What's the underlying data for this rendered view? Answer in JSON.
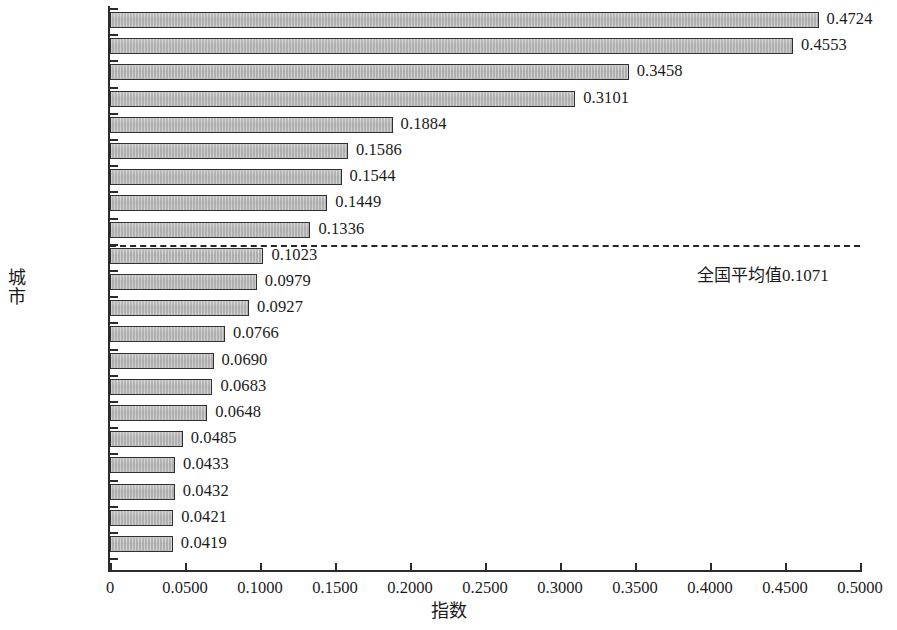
{
  "chart_data": {
    "type": "bar",
    "orientation": "horizontal",
    "title": "",
    "xlabel": "指数",
    "ylabel": "城市",
    "xlim": [
      0,
      0.5
    ],
    "grid": false,
    "legend": null,
    "xticks": [
      "0",
      "0.0500",
      "0.1000",
      "0.1500",
      "0.2000",
      "0.2500",
      "0.3000",
      "0.3500",
      "0.4000",
      "0.4500",
      "0.5000"
    ],
    "xtick_values": [
      0,
      0.05,
      0.1,
      0.15,
      0.2,
      0.25,
      0.3,
      0.35,
      0.4,
      0.45,
      0.5
    ],
    "categories": [
      "深圳市",
      "珠海市",
      "广州市",
      "惠州市",
      "东莞市",
      "佛山市",
      "湛江市",
      "中山市",
      "汕头市",
      "肇庆市",
      "梅州市",
      "江门市",
      "清远市",
      "潮州市",
      "茂名市",
      "阳江市",
      "揭阳市",
      "云浮市",
      "河源市",
      "韶关市",
      "汕尾市"
    ],
    "values": [
      0.4724,
      0.4553,
      0.3458,
      0.3101,
      0.1884,
      0.1586,
      0.1544,
      0.1449,
      0.1336,
      0.1023,
      0.0979,
      0.0927,
      0.0766,
      0.069,
      0.0683,
      0.0648,
      0.0485,
      0.0433,
      0.0432,
      0.0421,
      0.0419
    ],
    "value_labels": [
      "0.4724",
      "0.4553",
      "0.3458",
      "0.3101",
      "0.1884",
      "0.1586",
      "0.1544",
      "0.1449",
      "0.1336",
      "0.1023",
      "0.0979",
      "0.0927",
      "0.0766",
      "0.0690",
      "0.0683",
      "0.0648",
      "0.0485",
      "0.0433",
      "0.0432",
      "0.0421",
      "0.0419"
    ],
    "bar_color": "#b8b8b8",
    "bar_border_color": "#303030",
    "reference_line": {
      "value": 0.1071,
      "label": "全国平均值0.1071",
      "style": "dashed",
      "color": "#262626",
      "row_index": 9
    }
  }
}
